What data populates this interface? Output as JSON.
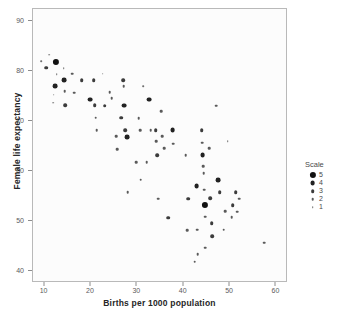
{
  "chart_data": {
    "type": "scatter",
    "title": "",
    "xlabel": "Births per 1000 population",
    "ylabel": "Female life expectancy",
    "xlim": [
      7.5,
      62.5
    ],
    "ylim": [
      37.5,
      92.5
    ],
    "xticks": [
      10,
      20,
      30,
      40,
      50,
      60
    ],
    "yticks": [
      40,
      50,
      60,
      70,
      80,
      90
    ],
    "grid": false,
    "legend": {
      "title": "Scale",
      "position": "right",
      "entries": [
        {
          "label": "5",
          "size": 5
        },
        {
          "label": "4",
          "size": 4
        },
        {
          "label": "3",
          "size": 3
        },
        {
          "label": "2",
          "size": 2
        },
        {
          "label": "1",
          "size": 1
        }
      ]
    },
    "size_encoding": "Scale",
    "points": [
      {
        "x": 9.3,
        "y": 82.0,
        "s": 1
      },
      {
        "x": 11.0,
        "y": 83.3,
        "s": 1
      },
      {
        "x": 10.4,
        "y": 80.7,
        "s": 3
      },
      {
        "x": 12.5,
        "y": 81.9,
        "s": 5
      },
      {
        "x": 12.6,
        "y": 79.4,
        "s": 1
      },
      {
        "x": 12.2,
        "y": 77.0,
        "s": 4
      },
      {
        "x": 12.0,
        "y": 75.3,
        "s": 1
      },
      {
        "x": 11.9,
        "y": 73.7,
        "s": 1
      },
      {
        "x": 14.1,
        "y": 80.6,
        "s": 1
      },
      {
        "x": 14.2,
        "y": 78.3,
        "s": 4
      },
      {
        "x": 14.3,
        "y": 76.0,
        "s": 2
      },
      {
        "x": 14.4,
        "y": 73.2,
        "s": 3
      },
      {
        "x": 16.0,
        "y": 79.5,
        "s": 2
      },
      {
        "x": 16.4,
        "y": 75.7,
        "s": 2
      },
      {
        "x": 18.0,
        "y": 78.2,
        "s": 3
      },
      {
        "x": 19.8,
        "y": 74.3,
        "s": 4
      },
      {
        "x": 20.6,
        "y": 78.2,
        "s": 3
      },
      {
        "x": 20.8,
        "y": 73.2,
        "s": 3
      },
      {
        "x": 21.0,
        "y": 70.7,
        "s": 2
      },
      {
        "x": 21.2,
        "y": 68.2,
        "s": 2
      },
      {
        "x": 22.5,
        "y": 79.5,
        "s": 1
      },
      {
        "x": 23.0,
        "y": 73.1,
        "s": 3
      },
      {
        "x": 24.0,
        "y": 75.8,
        "s": 2
      },
      {
        "x": 24.5,
        "y": 74.6,
        "s": 2
      },
      {
        "x": 25.4,
        "y": 67.0,
        "s": 2
      },
      {
        "x": 25.6,
        "y": 64.3,
        "s": 2
      },
      {
        "x": 26.5,
        "y": 70.7,
        "s": 3
      },
      {
        "x": 26.9,
        "y": 78.2,
        "s": 3
      },
      {
        "x": 27.1,
        "y": 77.0,
        "s": 2
      },
      {
        "x": 27.2,
        "y": 73.1,
        "s": 4
      },
      {
        "x": 27.4,
        "y": 68.2,
        "s": 3
      },
      {
        "x": 27.8,
        "y": 66.8,
        "s": 4
      },
      {
        "x": 27.9,
        "y": 55.7,
        "s": 2
      },
      {
        "x": 29.8,
        "y": 61.7,
        "s": 2
      },
      {
        "x": 30.3,
        "y": 70.6,
        "s": 2
      },
      {
        "x": 30.6,
        "y": 68.2,
        "s": 2
      },
      {
        "x": 30.7,
        "y": 58.2,
        "s": 2
      },
      {
        "x": 31.3,
        "y": 77.0,
        "s": 1
      },
      {
        "x": 32.0,
        "y": 61.8,
        "s": 2
      },
      {
        "x": 32.6,
        "y": 74.3,
        "s": 4
      },
      {
        "x": 32.9,
        "y": 68.2,
        "s": 2
      },
      {
        "x": 34.0,
        "y": 68.2,
        "s": 3
      },
      {
        "x": 34.1,
        "y": 66.0,
        "s": 2
      },
      {
        "x": 34.3,
        "y": 63.1,
        "s": 3
      },
      {
        "x": 34.5,
        "y": 54.4,
        "s": 2
      },
      {
        "x": 35.1,
        "y": 72.0,
        "s": 2
      },
      {
        "x": 35.4,
        "y": 67.0,
        "s": 2
      },
      {
        "x": 35.8,
        "y": 64.5,
        "s": 2
      },
      {
        "x": 36.6,
        "y": 50.6,
        "s": 3
      },
      {
        "x": 37.6,
        "y": 68.2,
        "s": 4
      },
      {
        "x": 37.8,
        "y": 65.5,
        "s": 2
      },
      {
        "x": 40.4,
        "y": 63.1,
        "s": 2
      },
      {
        "x": 40.8,
        "y": 48.1,
        "s": 2
      },
      {
        "x": 41.0,
        "y": 54.4,
        "s": 3
      },
      {
        "x": 42.4,
        "y": 41.8,
        "s": 2
      },
      {
        "x": 42.8,
        "y": 57.0,
        "s": 4
      },
      {
        "x": 42.9,
        "y": 48.2,
        "s": 2
      },
      {
        "x": 43.0,
        "y": 43.3,
        "s": 2
      },
      {
        "x": 43.9,
        "y": 68.2,
        "s": 3
      },
      {
        "x": 44.0,
        "y": 65.7,
        "s": 2
      },
      {
        "x": 44.1,
        "y": 63.1,
        "s": 4
      },
      {
        "x": 44.2,
        "y": 61.0,
        "s": 2
      },
      {
        "x": 44.3,
        "y": 59.5,
        "s": 2
      },
      {
        "x": 44.4,
        "y": 56.2,
        "s": 2
      },
      {
        "x": 44.5,
        "y": 53.2,
        "s": 5
      },
      {
        "x": 44.6,
        "y": 50.8,
        "s": 2
      },
      {
        "x": 44.7,
        "y": 44.6,
        "s": 2
      },
      {
        "x": 45.5,
        "y": 64.5,
        "s": 2
      },
      {
        "x": 45.7,
        "y": 54.5,
        "s": 3
      },
      {
        "x": 46.0,
        "y": 49.5,
        "s": 3
      },
      {
        "x": 46.2,
        "y": 46.9,
        "s": 3
      },
      {
        "x": 47.0,
        "y": 73.1,
        "s": 2
      },
      {
        "x": 47.5,
        "y": 58.2,
        "s": 4
      },
      {
        "x": 47.8,
        "y": 55.7,
        "s": 3
      },
      {
        "x": 48.6,
        "y": 48.2,
        "s": 2
      },
      {
        "x": 49.0,
        "y": 51.9,
        "s": 2
      },
      {
        "x": 49.5,
        "y": 66.0,
        "s": 1
      },
      {
        "x": 50.4,
        "y": 50.7,
        "s": 2
      },
      {
        "x": 50.6,
        "y": 53.1,
        "s": 3
      },
      {
        "x": 51.2,
        "y": 55.7,
        "s": 3
      },
      {
        "x": 51.6,
        "y": 51.8,
        "s": 2
      },
      {
        "x": 52.0,
        "y": 54.4,
        "s": 2
      },
      {
        "x": 57.4,
        "y": 45.6,
        "s": 2
      }
    ]
  }
}
